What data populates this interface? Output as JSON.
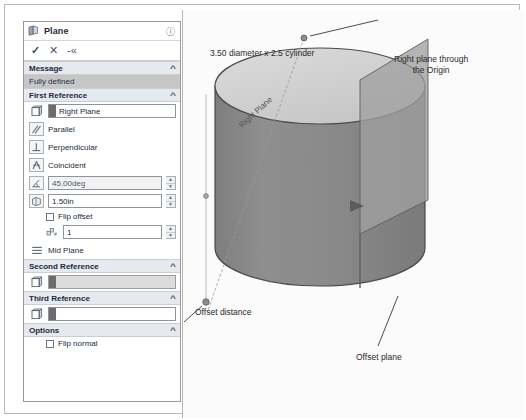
{
  "panel": {
    "title": "Plane",
    "help_icon": "help-icon",
    "actions": {
      "accept": "✓",
      "cancel": "✕",
      "pin": "-«"
    },
    "sections": {
      "message": {
        "header": "Message",
        "status": "Fully defined"
      },
      "first_reference": {
        "header": "First Reference",
        "reference_value": "Right Plane",
        "constraints": [
          {
            "label": "Parallel",
            "icon": "parallel-icon"
          },
          {
            "label": "Perpendicular",
            "icon": "perpendicular-icon"
          },
          {
            "label": "Coincident",
            "icon": "coincident-icon"
          }
        ],
        "angle_value": "45.00deg",
        "offset_value": "1.50in",
        "flip_offset_label": "Flip offset",
        "instance_count": "1",
        "mid_plane_label": "Mid Plane"
      },
      "second_reference": {
        "header": "Second Reference",
        "reference_value": ""
      },
      "third_reference": {
        "header": "Third Reference",
        "reference_value": ""
      },
      "options": {
        "header": "Options",
        "flip_normal_label": "Flip normal"
      }
    }
  },
  "viewport": {
    "annotations": {
      "title_note": "3.50 diameter x 2.5 cylinder",
      "right_plane_note": "Right plane through\nthe Origin",
      "offset_distance_note": "Offset distance",
      "offset_plane_note": "Offset plane",
      "plane_label_in_model": "Right Plane"
    },
    "colors": {
      "cylinder_side": "#8a8a8a",
      "cylinder_top": "#d2d2d2",
      "plane_face": "#9d9d9d",
      "background": "#fbfbfb"
    }
  }
}
